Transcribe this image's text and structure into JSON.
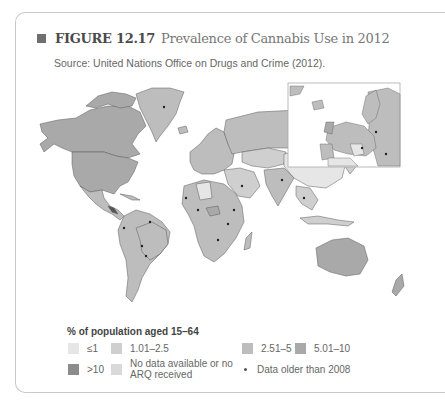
{
  "figure": {
    "label": "FIGURE 12.17",
    "caption": "Prevalence of Cannabis Use in 2012",
    "source": "Source: United Nations Office on Drugs and Crime (2012)."
  },
  "map": {
    "type": "choropleth world map",
    "inset": "Europe",
    "colors": {
      "le1": "#e6e6e6",
      "r1_2_5": "#cfcfcf",
      "r2_5_5": "#bdbdbd",
      "r5_10": "#a9a9a9",
      "gt10": "#8c8c8c",
      "nodata": "#d9d9d9",
      "border": "#5a5a5a",
      "water": "#ffffff"
    },
    "regions": [
      {
        "name": "North America",
        "category": "5.01-10"
      },
      {
        "name": "Greenland",
        "category": "2.51-5",
        "older_data": true
      },
      {
        "name": "South America",
        "category": "2.51-5"
      },
      {
        "name": "Europe",
        "category": "2.51-5"
      },
      {
        "name": "Russia",
        "category": "2.51-5"
      },
      {
        "name": "China",
        "category": "≤1"
      },
      {
        "name": "Africa",
        "category": "2.51-5"
      },
      {
        "name": "Australia",
        "category": "5.01-10"
      }
    ]
  },
  "legend": {
    "heading": "% of population aged 15–64",
    "items": [
      {
        "label": "≤1",
        "color": "#e6e6e6"
      },
      {
        "label": "1.01–2.5",
        "color": "#cfcfcf"
      },
      {
        "label": "2.51–5",
        "color": "#bdbdbd"
      },
      {
        "label": "5.01–10",
        "color": "#a9a9a9"
      },
      {
        "label": ">10",
        "color": "#8c8c8c"
      },
      {
        "label_line1": "No data available or no",
        "label_line2": "ARQ received",
        "color": "#d9d9d9"
      },
      {
        "label": "Data older than 2008",
        "marker": "dot"
      }
    ]
  }
}
